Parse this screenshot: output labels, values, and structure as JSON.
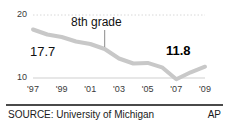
{
  "chart_data": {
    "type": "line",
    "title": "",
    "subtitle": "",
    "xlabel": "",
    "ylabel": "",
    "series_label": "8th grade",
    "x": [
      1997,
      1998,
      1999,
      2000,
      2001,
      2002,
      2003,
      2004,
      2005,
      2006,
      2007,
      2008,
      2009
    ],
    "values": [
      17.7,
      16.9,
      16.5,
      15.8,
      15.4,
      14.6,
      13.1,
      12.3,
      12.4,
      11.7,
      9.8,
      10.9,
      11.8
    ],
    "categories": [
      "'97",
      "",
      "'99",
      "",
      "'01",
      "",
      "'03",
      "",
      "'05",
      "",
      "'07",
      "",
      "'09"
    ],
    "tick_labels": [
      "'97",
      "'99",
      "'01",
      "'03",
      "'05",
      "'07",
      "'09"
    ],
    "tick_years": [
      1997,
      1999,
      2001,
      2003,
      2005,
      2007,
      2009
    ],
    "ylim": [
      10,
      20
    ],
    "xlim": [
      1997,
      2009
    ],
    "y_ticks": [
      "20",
      "10"
    ],
    "y_tick_values": [
      20,
      10
    ],
    "grid": "dotted-top-solid-bottom",
    "legend": "none",
    "line_color": "#c8c8c8",
    "annotations": [
      {
        "text": "8th grade",
        "at_year": 2002,
        "kind": "series-callout-with-leader"
      },
      {
        "text": "17.7",
        "at_year": 1997,
        "kind": "value-label",
        "bold": false
      },
      {
        "text": "11.8",
        "at_year": 2009,
        "kind": "value-label",
        "bold": true
      }
    ]
  },
  "axis": {
    "y_top": "20",
    "y_bottom": "10",
    "x_ticks": [
      {
        "label": "'97"
      },
      {
        "label": "'99"
      },
      {
        "label": "'01"
      },
      {
        "label": "'03"
      },
      {
        "label": "'05"
      },
      {
        "label": "'07"
      },
      {
        "label": "'09"
      }
    ]
  },
  "labels": {
    "series_callout": "8th grade",
    "start_value": "17.7",
    "end_value": "11.8"
  },
  "footer": {
    "source": "SOURCE: University of Michigan",
    "credit": "AP"
  },
  "colors": {
    "line": "#c8c8c8",
    "grid": "#d8d8d8",
    "baseline": "#cfcfcf",
    "rule": "#4a4a4a",
    "text": "#1a1a1a",
    "axis_text": "#3a3a3a"
  }
}
